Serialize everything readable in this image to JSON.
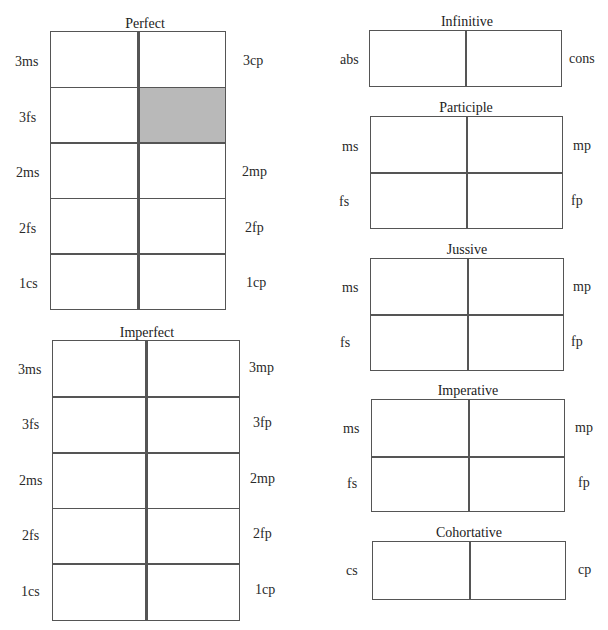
{
  "perfect": {
    "title": "Perfect",
    "left_labels": [
      "3ms",
      "3fs",
      "2ms",
      "2fs",
      "1cs"
    ],
    "right_labels": [
      "3cp",
      "",
      "2mp",
      "2fp",
      "1cp"
    ],
    "shaded_cell": {
      "row": 1,
      "col": 1,
      "color": "#b9b9b9"
    }
  },
  "imperfect": {
    "title": "Imperfect",
    "left_labels": [
      "3ms",
      "3fs",
      "2ms",
      "2fs",
      "1cs"
    ],
    "right_labels": [
      "3mp",
      "3fp",
      "2mp",
      "2fp",
      "1cp"
    ]
  },
  "infinitive": {
    "title": "Infinitive",
    "left_labels": [
      "abs"
    ],
    "right_labels": [
      "cons"
    ]
  },
  "participle": {
    "title": "Participle",
    "left_labels": [
      "ms",
      "fs"
    ],
    "right_labels": [
      "mp",
      "fp"
    ]
  },
  "jussive": {
    "title": "Jussive",
    "left_labels": [
      "ms",
      "fs"
    ],
    "right_labels": [
      "mp",
      "fp"
    ]
  },
  "imperative": {
    "title": "Imperative",
    "left_labels": [
      "ms",
      "fs"
    ],
    "right_labels": [
      "mp",
      "fp"
    ]
  },
  "cohortative": {
    "title": "Cohortative",
    "left_labels": [
      "cs"
    ],
    "right_labels": [
      "cp"
    ]
  }
}
